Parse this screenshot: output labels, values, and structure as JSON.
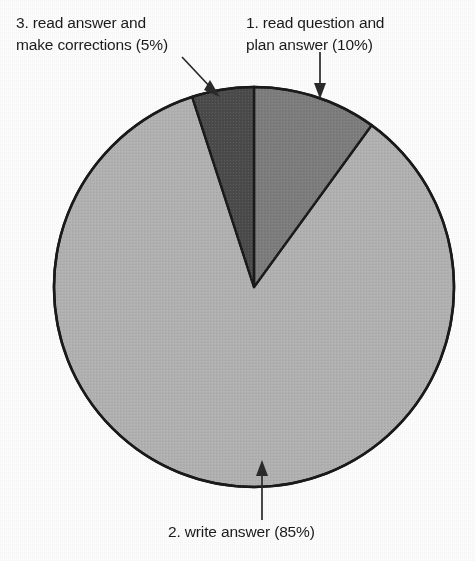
{
  "chart_data": {
    "type": "pie",
    "title": "",
    "subtitle": "",
    "xlabel": "",
    "ylabel": "",
    "legend_position": "none",
    "grid": false,
    "start_angle_deg": 0,
    "direction": "clockwise",
    "total": 100,
    "units": "%",
    "categories": [
      "1. read question and plan answer",
      "2. write answer",
      "3. read answer and make corrections"
    ],
    "values": [
      10,
      85,
      5
    ],
    "slices": [
      {
        "index": 1,
        "name": "read question and plan answer",
        "label_line1": "1. read question and",
        "label_line2": "plan answer (10%)",
        "label_full": "1. read question and plan answer (10%)",
        "value": 10,
        "percent_text": "10%",
        "color": "#7d7d7d",
        "start_deg": 0,
        "end_deg": 36
      },
      {
        "index": 2,
        "name": "write answer",
        "label_line1": "2. write answer (85%)",
        "label_line2": "",
        "label_full": "2. write answer (85%)",
        "value": 85,
        "percent_text": "85%",
        "color": "#b2b2b2",
        "start_deg": 36,
        "end_deg": 342
      },
      {
        "index": 3,
        "name": "read answer and make corrections",
        "label_line1": "3. read answer and",
        "label_line2": "make corrections (5%)",
        "label_full": "3. read answer and make corrections (5%)",
        "value": 5,
        "percent_text": "5%",
        "color": "#4b4b4b",
        "start_deg": 342,
        "end_deg": 360
      }
    ]
  },
  "labels": {
    "corrections": "3. read answer and\nmake corrections (5%)",
    "plan": "1. read question and\nplan answer (10%)",
    "write": "2. write answer (85%)"
  },
  "colors": {
    "background": "#fdfdfd",
    "outline": "#1a1a1a",
    "text": "#1b1b1b",
    "slice_plan": "#7d7d7d",
    "slice_write": "#b2b2b2",
    "slice_corrections": "#4b4b4b",
    "leader": "#2a2a2a"
  }
}
